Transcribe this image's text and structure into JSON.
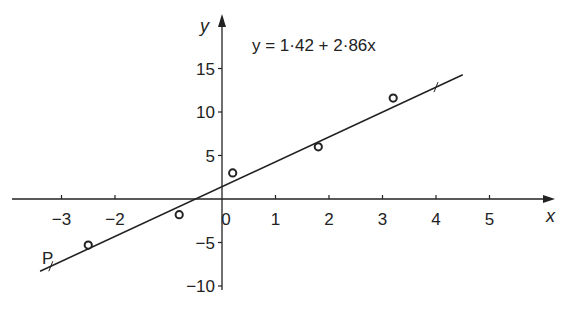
{
  "chart_data": {
    "type": "scatter",
    "title": "",
    "equation": "y = 1·42 + 2·86x",
    "xlabel": "x",
    "ylabel": "y",
    "x_ticks": [
      -3,
      -2,
      0,
      1,
      2,
      3,
      4,
      5
    ],
    "x_tick_labels": [
      "−3",
      "−2",
      "0",
      "1",
      "2",
      "3",
      "4",
      "5"
    ],
    "y_ticks": [
      15,
      10,
      5,
      -5,
      -10
    ],
    "y_tick_labels": [
      "15",
      "10",
      "5",
      "−5",
      "−10"
    ],
    "xlim": [
      -3.8,
      6
    ],
    "ylim": [
      -11,
      20
    ],
    "grid": false,
    "points": [
      {
        "x": -2.5,
        "y": -5.3
      },
      {
        "x": -0.8,
        "y": -1.8
      },
      {
        "x": 0.2,
        "y": 3.0
      },
      {
        "x": 1.8,
        "y": 6.0
      },
      {
        "x": 3.2,
        "y": 11.6
      }
    ],
    "regression_line": {
      "intercept": 1.42,
      "slope": 2.86,
      "x_from": -3.4,
      "x_to": 4.5
    },
    "annotations": [
      {
        "label": "P",
        "x": -3.2,
        "y": -7.7
      }
    ]
  }
}
